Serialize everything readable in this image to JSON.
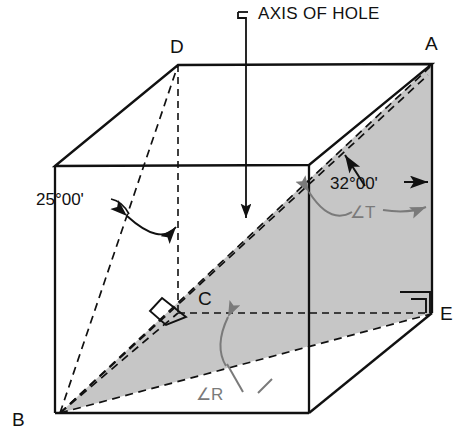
{
  "figure": {
    "type": "engineering-pictorial-drawing",
    "background_color": "#ffffff",
    "line_color": "#111111",
    "shade_fill": "#c6c6c6",
    "gray_annotation_color": "#7a7a7a"
  },
  "callouts": {
    "axis_of_hole": "AXIS OF HOLE"
  },
  "vertices": [
    {
      "name": "vertex-a",
      "label": "A"
    },
    {
      "name": "vertex-b",
      "label": "B"
    },
    {
      "name": "vertex-c",
      "label": "C"
    },
    {
      "name": "vertex-d",
      "label": "D"
    },
    {
      "name": "vertex-e",
      "label": "E"
    }
  ],
  "dimensions": [
    {
      "name": "angle-25",
      "label": "25°00'",
      "value": 25,
      "unit": "degrees-minutes"
    },
    {
      "name": "angle-32",
      "label": "32°00'",
      "value": 32,
      "unit": "degrees-minutes"
    }
  ],
  "angle_symbols": [
    {
      "name": "angle-t",
      "label": "∠T"
    },
    {
      "name": "angle-r",
      "label": "∠R"
    }
  ],
  "markers": {
    "right_angle_count": 3
  }
}
